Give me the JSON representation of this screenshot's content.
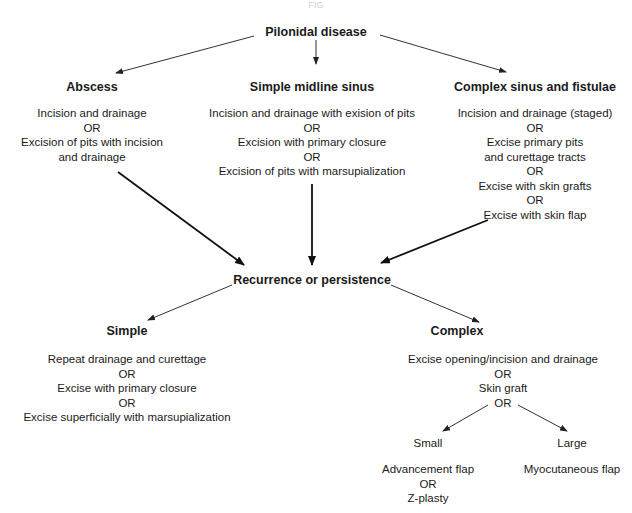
{
  "diagram": {
    "header_partial": "FIG",
    "root": {
      "label": "Pilonidal disease"
    },
    "primary": [
      {
        "title": "Abscess",
        "options": [
          "Incision and drainage",
          "OR",
          "Excision of pits with incision",
          "and drainage"
        ]
      },
      {
        "title": "Simple midline sinus",
        "options": [
          "Incision and drainage with exision of pits",
          "OR",
          "Excision with primary closure",
          "OR",
          "Excision of pits with marsupialization"
        ]
      },
      {
        "title": "Complex sinus and fistulae",
        "options": [
          "Incision and drainage (staged)",
          "OR",
          "Excise primary pits",
          "and curettage tracts",
          "OR",
          "Excise with skin grafts",
          "OR",
          "Excise with skin flap"
        ]
      }
    ],
    "recurrence": {
      "label": "Recurrence or persistence"
    },
    "secondary": [
      {
        "title": "Simple",
        "options": [
          "Repeat drainage and curettage",
          "OR",
          "Excise with primary closure",
          "OR",
          "Excise superficially with marsupialization"
        ]
      },
      {
        "title": "Complex",
        "options": [
          "Excise opening/incision and drainage",
          "OR",
          "Skin graft",
          "OR"
        ]
      }
    ],
    "flap_branches": [
      {
        "title": "Small",
        "options": [
          "Advancement flap",
          "OR",
          "Z-plasty"
        ]
      },
      {
        "title": "Large",
        "options": [
          "Myocutaneous flap"
        ]
      }
    ],
    "colors": {
      "line": "#222222",
      "text": "#1a1a1a",
      "background": "#ffffff"
    }
  }
}
